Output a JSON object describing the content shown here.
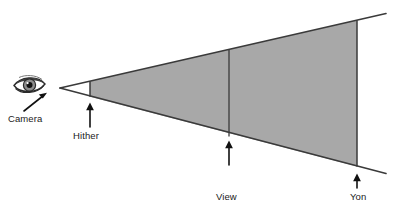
{
  "diagram": {
    "type": "perspective-viewing-frustum",
    "colors": {
      "frustum_fill": "#a8a8a8",
      "stroke": "#3a3a3a",
      "text": "#1a1a1a",
      "background": "#ffffff"
    },
    "labels": {
      "camera": "Camera",
      "hither": "Hither",
      "view_plane_line1": "View",
      "view_plane_line2": "Plane",
      "yon": "Yon"
    },
    "icons": {
      "eye": "eye-icon",
      "camera_pointer": "arrow-icon",
      "hither_pointer": "arrow-icon",
      "view_plane_pointer": "arrow-icon",
      "yon_pointer": "arrow-icon"
    },
    "geometry": {
      "apex": [
        60,
        88
      ],
      "top_ray_end": [
        385,
        14
      ],
      "bottom_ray_end": [
        385,
        173
      ],
      "hither_plane_x": 90,
      "view_plane_x": 229,
      "yon_plane_x": 357
    }
  }
}
